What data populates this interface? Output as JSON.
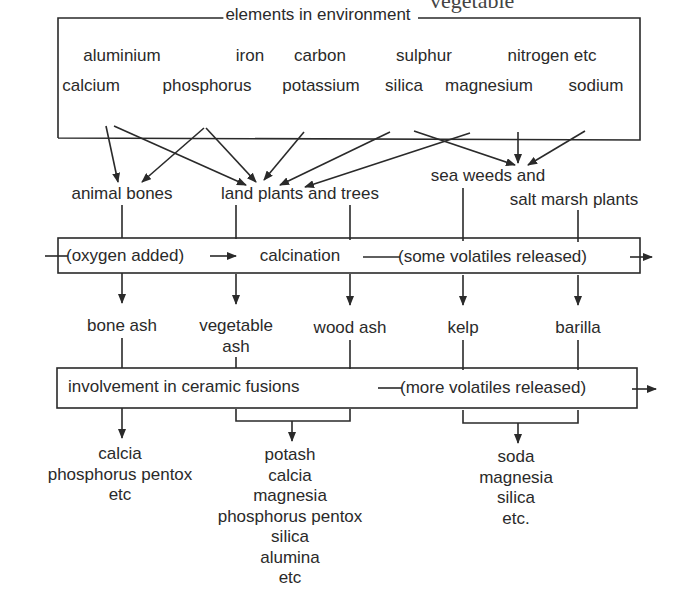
{
  "header_fragment": "vegetable",
  "environment_box": {
    "title": "elements in environment",
    "row1": [
      "aluminium",
      "iron",
      "carbon",
      "sulphur",
      "nitrogen etc"
    ],
    "row2": [
      "calcium",
      "phosphorus",
      "potassium",
      "silica",
      "magnesium",
      "sodium"
    ]
  },
  "sources": {
    "animal_bones": "animal bones",
    "land_plants": "land plants and trees",
    "sea_weeds_line1": "sea weeds and",
    "sea_weeds_line2": "salt marsh plants"
  },
  "calcination_box": {
    "oxygen": "(oxygen added)",
    "label": "calcination",
    "volatiles": "(some volatiles released)"
  },
  "products": {
    "bone_ash": "bone ash",
    "vegetable_ash_line1": "vegetable",
    "vegetable_ash_line2": "ash",
    "wood_ash": "wood ash",
    "kelp": "kelp",
    "barilla": "barilla"
  },
  "ceramic_box": {
    "label": "involvement in ceramic fusions",
    "volatiles": "(more volatiles released)"
  },
  "outputs": {
    "bone": [
      "calcia",
      "phosphorus pentox",
      "etc"
    ],
    "plant": [
      "potash",
      "calcia",
      "magnesia",
      "phosphorus pentox",
      "silica",
      "alumina",
      "etc"
    ],
    "sea": [
      "soda",
      "magnesia",
      "silica",
      "etc."
    ]
  },
  "line_color": "#2a2a2a"
}
